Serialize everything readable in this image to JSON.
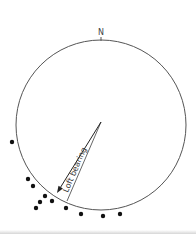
{
  "diagram": {
    "north_label": "N",
    "bearing_label": "Loft bearing",
    "circle": {
      "cx": 101,
      "cy": 125,
      "r": 85,
      "stroke": "#555555"
    },
    "arrow": {
      "x1": 101,
      "y1": 122,
      "x2": 57,
      "y2": 193,
      "color": "#222222"
    },
    "bearing_line": {
      "x1": 101,
      "y1": 122,
      "x2": 67,
      "y2": 201,
      "color": "#555555"
    },
    "dots": [
      {
        "x": 12,
        "y": 142
      },
      {
        "x": 28,
        "y": 179
      },
      {
        "x": 33,
        "y": 186
      },
      {
        "x": 45,
        "y": 196
      },
      {
        "x": 40,
        "y": 202
      },
      {
        "x": 36,
        "y": 208
      },
      {
        "x": 52,
        "y": 201
      },
      {
        "x": 66,
        "y": 208
      },
      {
        "x": 81,
        "y": 214
      },
      {
        "x": 103,
        "y": 216
      },
      {
        "x": 120,
        "y": 214
      }
    ],
    "dot_color": "#111111"
  }
}
